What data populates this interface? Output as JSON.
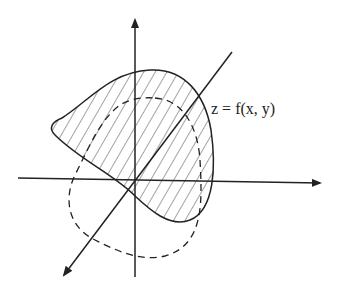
{
  "diagram": {
    "title": "",
    "surface_label": "z = f(x, y)",
    "axes": {
      "vertical": {
        "name": "vertical-axis",
        "from": [
          135,
          278
        ],
        "to": [
          135,
          18
        ]
      },
      "horizontal": {
        "name": "horizontal-axis",
        "from": [
          18,
          178
        ],
        "to": [
          322,
          183
        ]
      },
      "diagonal": {
        "name": "diagonal-axis",
        "from": [
          232,
          52
        ],
        "to": [
          62,
          278
        ]
      }
    },
    "regions": [
      {
        "name": "surface-region",
        "style": "solid",
        "fill": "hatched"
      },
      {
        "name": "projected-domain",
        "style": "dashed",
        "fill": "none"
      }
    ],
    "colors": {
      "stroke": "#222222",
      "background": "#ffffff"
    }
  }
}
